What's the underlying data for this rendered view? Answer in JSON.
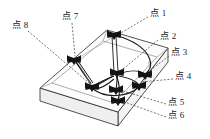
{
  "figure": {
    "type": "technical-diagram",
    "background_color": "#ffffff",
    "line_color": "#1a1a1a",
    "plate_face_color": "#fbfbfb",
    "plate_side_color": "#f2f2f2",
    "leader_style": "dashed"
  },
  "labels": [
    {
      "id": "point-1",
      "text": "点 1",
      "x": 150,
      "y": 14,
      "anchor_x": 120,
      "anchor_y": 35
    },
    {
      "id": "point-2",
      "text": "点 2",
      "x": 160,
      "y": 37,
      "anchor_x": 120,
      "anchor_y": 72
    },
    {
      "id": "point-3",
      "text": "点 3",
      "x": 171,
      "y": 53,
      "anchor_x": 139,
      "anchor_y": 78
    },
    {
      "id": "point-4",
      "text": "点 4",
      "x": 175,
      "y": 77,
      "anchor_x": 139,
      "anchor_y": 80
    },
    {
      "id": "point-5",
      "text": "点 5",
      "x": 168,
      "y": 103,
      "anchor_x": 116,
      "anchor_y": 92
    },
    {
      "id": "point-6",
      "text": "点 6",
      "x": 168,
      "y": 116,
      "anchor_x": 116,
      "anchor_y": 95
    },
    {
      "id": "point-7",
      "text": "点 7",
      "x": 62,
      "y": 17,
      "anchor_x": 74,
      "anchor_y": 59
    },
    {
      "id": "point-8",
      "text": "点 8",
      "x": 12,
      "y": 26,
      "anchor_x": 72,
      "anchor_y": 62
    }
  ],
  "markers": [
    {
      "id": "marker-1",
      "x": 114,
      "y": 34,
      "size": 11,
      "label_ref": "点 1"
    },
    {
      "id": "marker-2",
      "x": 117,
      "y": 72,
      "size": 11,
      "label_ref": "点 2"
    },
    {
      "id": "marker-3",
      "x": 145,
      "y": 74,
      "size": 10,
      "label_ref": "点 3"
    },
    {
      "id": "marker-4",
      "x": 139,
      "y": 85,
      "size": 10,
      "label_ref": "点 4"
    },
    {
      "id": "marker-5",
      "x": 116,
      "y": 89,
      "size": 10,
      "label_ref": "点 5"
    },
    {
      "id": "marker-6",
      "x": 118,
      "y": 100,
      "size": 10,
      "label_ref": "点 6"
    },
    {
      "id": "marker-7",
      "x": 74,
      "y": 59,
      "size": 11,
      "label_ref": "点 7"
    },
    {
      "id": "marker-8",
      "x": 92,
      "y": 86,
      "size": 11,
      "label_ref": "点 8"
    }
  ],
  "plate": {
    "top_face": "107,30 168,48 118,112 40,88",
    "front_left_edge": "40,88 40,101 118,126 118,112",
    "front_right_edge": "118,112 118,126 168,62 168,48",
    "inner_top_face": "103,40 156,56 114,104 50,84"
  }
}
